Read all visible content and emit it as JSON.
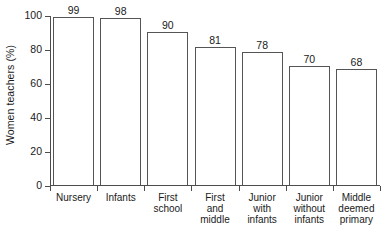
{
  "chart_data": {
    "type": "bar",
    "title": "",
    "subtitle": "",
    "xlabel": "",
    "ylabel": "Women teachers (%)",
    "ylim": [
      0,
      100
    ],
    "yticks": [
      0,
      20,
      40,
      60,
      80,
      100
    ],
    "ytick_labels": [
      "0",
      "20",
      "40",
      "60",
      "80",
      "100"
    ],
    "grid": false,
    "legend": false,
    "categories": [
      "Nursery",
      "Infants",
      "First school",
      "First and middle",
      "Junior with infants",
      "Junior without infants",
      "Middle deemed primary"
    ],
    "category_lines": [
      [
        "Nursery"
      ],
      [
        "Infants"
      ],
      [
        "First",
        "school"
      ],
      [
        "First",
        "and",
        "middle"
      ],
      [
        "Junior",
        "with",
        "infants"
      ],
      [
        "Junior",
        "without",
        "infants"
      ],
      [
        "Middle",
        "deemed",
        "primary"
      ]
    ],
    "values": [
      99,
      98,
      90,
      81,
      78,
      70,
      68
    ],
    "value_labels": [
      "99",
      "98",
      "90",
      "81",
      "78",
      "70",
      "68"
    ],
    "colors": {
      "bar_fill": "#ffffff",
      "bar_stroke": "#555555",
      "axis": "#4d4d4d",
      "text": "#1a1a1a",
      "background": "#ffffff"
    }
  }
}
